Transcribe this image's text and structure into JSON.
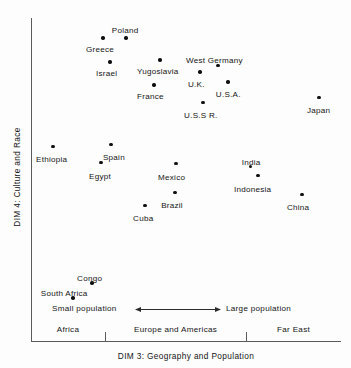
{
  "chart_data": {
    "type": "scatter",
    "title": "",
    "xlabel": "DIM 3:  Geography and Population",
    "ylabel": "DIM 4:  Culture and Race",
    "xlim": [
      0,
      100
    ],
    "ylim": [
      0,
      100
    ],
    "grid": false,
    "legend": null,
    "axis_note": "Unlabeled perceptual-map axes; positions read off pixel coordinates and normalized 0-100 across the plotting frame.",
    "points": [
      {
        "label": "Poland",
        "x": 30.6,
        "y": 93.8,
        "label_dx": -14,
        "label_dy": -11
      },
      {
        "label": "Greece",
        "x": 23.2,
        "y": 93.8,
        "label_dx": -17,
        "label_dy": 8
      },
      {
        "label": "Israel",
        "x": 25.5,
        "y": 86.4,
        "label_dx": -14,
        "label_dy": 8
      },
      {
        "label": "Yugoslavia",
        "x": 41.6,
        "y": 87.0,
        "label_dx": -23,
        "label_dy": 8
      },
      {
        "label": "France",
        "x": 39.7,
        "y": 79.3,
        "label_dx": -17,
        "label_dy": 8
      },
      {
        "label": "West Germany",
        "x": 60.3,
        "y": 85.2,
        "label_dx": -32,
        "label_dy": -9
      },
      {
        "label": "U.K.",
        "x": 54.5,
        "y": 83.3,
        "label_dx": -12,
        "label_dy": 9
      },
      {
        "label": "U.S.A.",
        "x": 63.5,
        "y": 80.2,
        "label_dx": -12,
        "label_dy": 9
      },
      {
        "label": "U.S.S R.",
        "x": 55.5,
        "y": 73.8,
        "label_dx": -19,
        "label_dy": 9
      },
      {
        "label": "Japan",
        "x": 92.9,
        "y": 75.3,
        "label_dx": -12,
        "label_dy": 9
      },
      {
        "label": "Ethiopia",
        "x": 7.1,
        "y": 60.2,
        "label_dx": -17,
        "label_dy": 9
      },
      {
        "label": "Spain",
        "x": 25.8,
        "y": 60.8,
        "label_dx": -8,
        "label_dy": 9
      },
      {
        "label": "Egypt",
        "x": 22.6,
        "y": 55.2,
        "label_dx": -12,
        "label_dy": 10
      },
      {
        "label": "Mexico",
        "x": 46.8,
        "y": 54.9,
        "label_dx": -18,
        "label_dy": 10
      },
      {
        "label": "India",
        "x": 70.9,
        "y": 54.0,
        "label_dx": -9,
        "label_dy": -8
      },
      {
        "label": "Indonesia",
        "x": 73.2,
        "y": 51.2,
        "label_dx": -24,
        "label_dy": 10
      },
      {
        "label": "Brazil",
        "x": 46.5,
        "y": 46.0,
        "label_dx": -14,
        "label_dy": 10
      },
      {
        "label": "China",
        "x": 87.4,
        "y": 45.4,
        "label_dx": -15,
        "label_dy": 10
      },
      {
        "label": "Cuba",
        "x": 36.8,
        "y": 42.0,
        "label_dx": -12,
        "label_dy": 10
      },
      {
        "label": "Congo",
        "x": 19.7,
        "y": 17.9,
        "label_dx": -15,
        "label_dy": -8
      },
      {
        "label": "South Africa",
        "x": 13.5,
        "y": 13.3,
        "label_dx": -32,
        "label_dy": -8
      }
    ],
    "x_regions": [
      {
        "label": "Africa",
        "start": 0.0,
        "end": 23.9
      },
      {
        "label": "Europe and Americas",
        "start": 23.9,
        "end": 69.4
      },
      {
        "label": "Far East",
        "start": 69.4,
        "end": 100.0
      }
    ],
    "x_ticks": [
      23.9,
      69.4
    ],
    "annotation": {
      "left_label": "Small population",
      "right_label": "Large population",
      "arrow": "double-headed-horizontal"
    }
  },
  "colors": {
    "background": "#fdfdfd",
    "axis": "#5a5a5a",
    "point": "#101010",
    "text": "#141414"
  }
}
